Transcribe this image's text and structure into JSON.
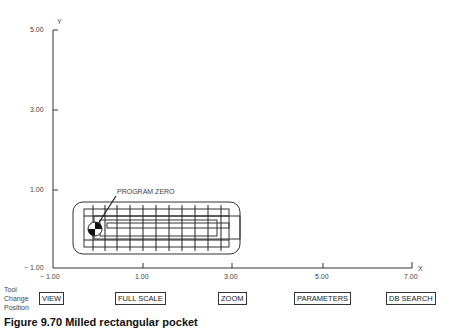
{
  "axes": {
    "y_label": "Y",
    "x_label": "X",
    "y_ticks": [
      "5.00",
      "3.00",
      "1.00",
      "− 1.00"
    ],
    "x_ticks": [
      "− 1.00",
      "1.00",
      "3.00",
      "5.00",
      "7.00"
    ]
  },
  "annotation": "PROGRAM ZERO",
  "tool_change": [
    "Tool",
    "Change",
    "Position"
  ],
  "buttons": {
    "view": "VIEW",
    "full_scale": "FULL SCALE",
    "zoom": "ZOOM",
    "parameters": "PARAMETERS",
    "db_search": "DB SEARCH"
  },
  "caption": "Figure 9.70 Milled rectangular pocket"
}
